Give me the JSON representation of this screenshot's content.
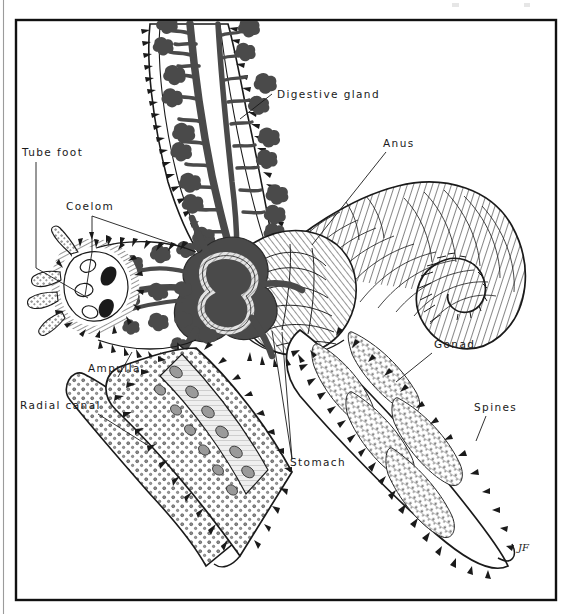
{
  "figure": {
    "type": "scientific-illustration",
    "background_color": "#ffffff",
    "ink_color": "#1a1a1a",
    "frame": {
      "x": 16,
      "y": 20,
      "width": 540,
      "height": 580,
      "stroke": "#111111"
    },
    "signature": {
      "text": "JF",
      "x": 518,
      "y": 551
    },
    "labels": [
      {
        "id": "digestive-gland",
        "text": "Digestive gland",
        "x": 277,
        "y": 98,
        "anchor": "start",
        "leader": [
          [
            272,
            94
          ],
          [
            240,
            119
          ]
        ]
      },
      {
        "id": "anus",
        "text": "Anus",
        "x": 383,
        "y": 147,
        "anchor": "start",
        "leader": [
          [
            386,
            152
          ],
          [
            312,
            245
          ]
        ]
      },
      {
        "id": "tube-foot",
        "text": "Tube foot",
        "x": 22,
        "y": 156,
        "anchor": "start",
        "leader": [
          [
            36,
            162
          ],
          [
            36,
            268
          ],
          [
            88,
            298
          ]
        ]
      },
      {
        "id": "coelom",
        "text": "Coelom",
        "x": 66,
        "y": 210,
        "anchor": "start",
        "leader": [
          [
            92,
            216
          ],
          [
            92,
            252
          ],
          [
            85,
            296
          ]
        ]
      },
      {
        "id": "coelom-branch",
        "text": "",
        "x": 0,
        "y": 0,
        "anchor": "start",
        "leader": [
          [
            92,
            216
          ],
          [
            185,
            248
          ]
        ]
      },
      {
        "id": "gonad",
        "text": "Gonad",
        "x": 434,
        "y": 348,
        "anchor": "start",
        "leader": [
          [
            432,
            353
          ],
          [
            396,
            382
          ]
        ]
      },
      {
        "id": "ampulla",
        "text": "Ampulla",
        "x": 88,
        "y": 372,
        "anchor": "start",
        "leader": [
          [
            118,
            377
          ],
          [
            132,
            352
          ]
        ]
      },
      {
        "id": "spines",
        "text": "Spines",
        "x": 474,
        "y": 411,
        "anchor": "start",
        "leader": [
          [
            486,
            416
          ],
          [
            476,
            441
          ]
        ]
      },
      {
        "id": "radial-canal",
        "text": "Radial canal",
        "x": 20,
        "y": 409,
        "anchor": "start",
        "leader": [
          [
            98,
            414
          ],
          [
            152,
            448
          ]
        ]
      },
      {
        "id": "stomach",
        "text": "Stomach",
        "x": 290,
        "y": 466,
        "anchor": "start",
        "leader": [
          [
            292,
            459
          ],
          [
            272,
            331
          ]
        ]
      },
      {
        "id": "stomach-b",
        "text": "",
        "x": 0,
        "y": 0,
        "anchor": "start",
        "leader": [
          [
            292,
            459
          ],
          [
            282,
            332
          ]
        ]
      }
    ],
    "structures": [
      {
        "name": "digestive-gland-upper-left-arm",
        "description": "Dark branched pyloric caeca filling upper-left arm"
      },
      {
        "name": "digestive-gland-central",
        "description": "Dark branched pyloric caeca radiating from the central disc"
      },
      {
        "name": "anus-aboral-arm",
        "description": "Hatched aboral surface of the up-curved right arm"
      },
      {
        "name": "stomach-central-disc",
        "description": "Central stomach region shown in hatched tone"
      },
      {
        "name": "gonad-lower-right-arm",
        "description": "Stippled paired gonads in lower-right arm"
      },
      {
        "name": "tube-feet-left-arm",
        "description": "Cut-away left arm showing rows of tube feet and ampullae"
      },
      {
        "name": "radial-canal-lower-left-arm",
        "description": "Pale radial canal running the length of the lower-left arm"
      },
      {
        "name": "spines-margin",
        "description": "Marginal spines along arm edges"
      },
      {
        "name": "coelom-cavity",
        "description": "Body cavity space in the cut-away arm"
      }
    ]
  }
}
